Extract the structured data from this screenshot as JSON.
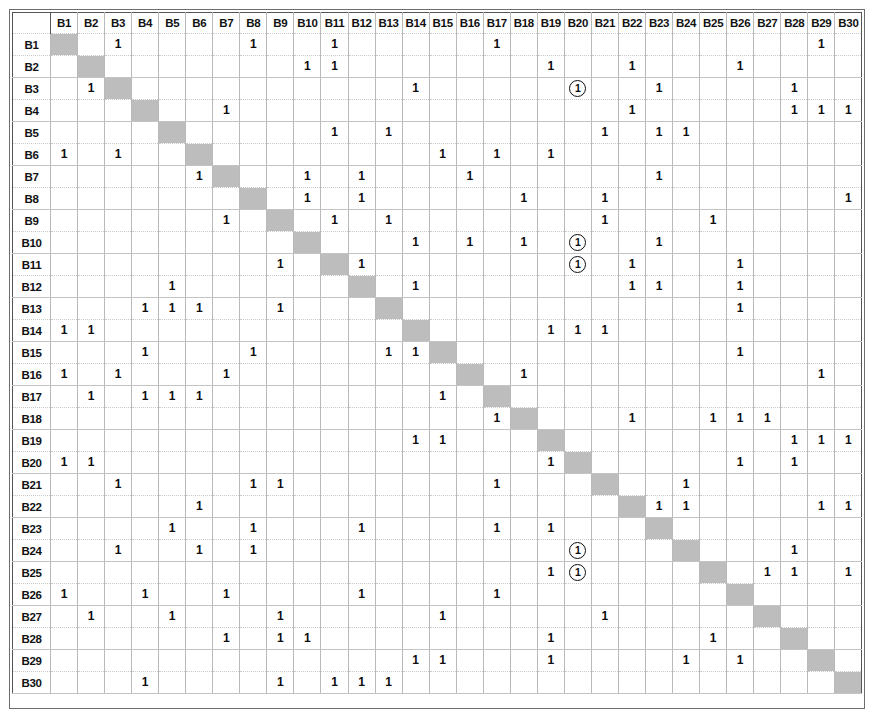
{
  "matrix": {
    "title": "Binary interaction matrix",
    "size": 30,
    "prefix": "B",
    "mark_value": "1",
    "columns": [
      "B1",
      "B2",
      "B3",
      "B4",
      "B5",
      "B6",
      "B7",
      "B8",
      "B9",
      "B10",
      "B11",
      "B12",
      "B13",
      "B14",
      "B15",
      "B16",
      "B17",
      "B18",
      "B19",
      "B20",
      "B21",
      "B22",
      "B23",
      "B24",
      "B25",
      "B26",
      "B27",
      "B28",
      "B29",
      "B30"
    ],
    "rows": [
      "B1",
      "B2",
      "B3",
      "B4",
      "B5",
      "B6",
      "B7",
      "B8",
      "B9",
      "B10",
      "B11",
      "B12",
      "B13",
      "B14",
      "B15",
      "B16",
      "B17",
      "B18",
      "B19",
      "B20",
      "B21",
      "B22",
      "B23",
      "B24",
      "B25",
      "B26",
      "B27",
      "B28",
      "B29",
      "B30"
    ],
    "diagonal_color": "#bdbdbd",
    "grid_color": "#b9b9b9",
    "border_color": "#555555",
    "legend": {
      "plain_mark": "1",
      "circled_mark": "1 (circled)"
    },
    "cells": [
      {
        "row": "B1",
        "marks": [
          "B3",
          "B8",
          "B11",
          "B17",
          "B29"
        ],
        "circled": []
      },
      {
        "row": "B2",
        "marks": [
          "B10",
          "B11",
          "B19",
          "B22",
          "B26"
        ],
        "circled": []
      },
      {
        "row": "B3",
        "marks": [
          "B2",
          "B14",
          "B23",
          "B28"
        ],
        "circled": [
          "B20"
        ]
      },
      {
        "row": "B4",
        "marks": [
          "B7",
          "B22",
          "B28",
          "B29",
          "B30"
        ],
        "circled": []
      },
      {
        "row": "B5",
        "marks": [
          "B11",
          "B13",
          "B21",
          "B23",
          "B24"
        ],
        "circled": []
      },
      {
        "row": "B6",
        "marks": [
          "B1",
          "B3",
          "B15",
          "B17",
          "B19"
        ],
        "circled": []
      },
      {
        "row": "B7",
        "marks": [
          "B6",
          "B10",
          "B12",
          "B16",
          "B23"
        ],
        "circled": []
      },
      {
        "row": "B8",
        "marks": [
          "B10",
          "B12",
          "B18",
          "B21",
          "B30"
        ],
        "circled": []
      },
      {
        "row": "B9",
        "marks": [
          "B7",
          "B11",
          "B13",
          "B21",
          "B25"
        ],
        "circled": []
      },
      {
        "row": "B10",
        "marks": [
          "B14",
          "B16",
          "B18",
          "B23"
        ],
        "circled": [
          "B20"
        ]
      },
      {
        "row": "B11",
        "marks": [
          "B9",
          "B12",
          "B22",
          "B26"
        ],
        "circled": [
          "B20"
        ]
      },
      {
        "row": "B12",
        "marks": [
          "B5",
          "B14",
          "B22",
          "B23",
          "B26"
        ],
        "circled": []
      },
      {
        "row": "B13",
        "marks": [
          "B4",
          "B5",
          "B6",
          "B9",
          "B26"
        ],
        "circled": []
      },
      {
        "row": "B14",
        "marks": [
          "B1",
          "B2",
          "B19",
          "B20",
          "B21"
        ],
        "circled": []
      },
      {
        "row": "B15",
        "marks": [
          "B4",
          "B8",
          "B13",
          "B14",
          "B26"
        ],
        "circled": []
      },
      {
        "row": "B16",
        "marks": [
          "B1",
          "B3",
          "B7",
          "B18",
          "B29"
        ],
        "circled": []
      },
      {
        "row": "B17",
        "marks": [
          "B2",
          "B4",
          "B5",
          "B6",
          "B15"
        ],
        "circled": []
      },
      {
        "row": "B18",
        "marks": [
          "B17",
          "B22",
          "B25",
          "B26",
          "B27"
        ],
        "circled": []
      },
      {
        "row": "B19",
        "marks": [
          "B14",
          "B15",
          "B28",
          "B29",
          "B30"
        ],
        "circled": []
      },
      {
        "row": "B20",
        "marks": [
          "B1",
          "B2",
          "B19",
          "B26",
          "B28"
        ],
        "circled": []
      },
      {
        "row": "B21",
        "marks": [
          "B3",
          "B8",
          "B9",
          "B17",
          "B24"
        ],
        "circled": []
      },
      {
        "row": "B22",
        "marks": [
          "B6",
          "B23",
          "B24",
          "B29",
          "B30"
        ],
        "circled": []
      },
      {
        "row": "B23",
        "marks": [
          "B5",
          "B8",
          "B12",
          "B17",
          "B19"
        ],
        "circled": []
      },
      {
        "row": "B24",
        "marks": [
          "B3",
          "B6",
          "B8",
          "B28"
        ],
        "circled": [
          "B20"
        ]
      },
      {
        "row": "B25",
        "marks": [
          "B19",
          "B27",
          "B28",
          "B30"
        ],
        "circled": [
          "B20"
        ]
      },
      {
        "row": "B26",
        "marks": [
          "B1",
          "B4",
          "B7",
          "B12",
          "B17"
        ],
        "circled": []
      },
      {
        "row": "B27",
        "marks": [
          "B2",
          "B5",
          "B9",
          "B15",
          "B21"
        ],
        "circled": []
      },
      {
        "row": "B28",
        "marks": [
          "B7",
          "B9",
          "B10",
          "B19",
          "B25"
        ],
        "circled": []
      },
      {
        "row": "B29",
        "marks": [
          "B14",
          "B15",
          "B19",
          "B24",
          "B26"
        ],
        "circled": []
      },
      {
        "row": "B30",
        "marks": [
          "B4",
          "B9",
          "B11",
          "B12",
          "B13"
        ],
        "circled": []
      }
    ]
  }
}
